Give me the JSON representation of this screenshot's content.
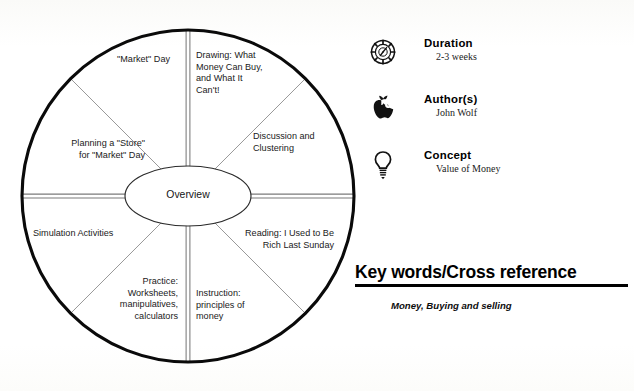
{
  "wheel": {
    "center_label": "Overview",
    "sectors": [
      {
        "id": "market-day",
        "label": "\"Market\" Day"
      },
      {
        "id": "drawing",
        "label": "Drawing: What\nMoney Can Buy,\nand What It\nCan't!"
      },
      {
        "id": "discussion",
        "label": "Discussion and\nClustering"
      },
      {
        "id": "reading",
        "label": "Reading:  I Used to Be\nRich Last Sunday"
      },
      {
        "id": "instruction",
        "label": "Instruction:\nprinciples of\nmoney"
      },
      {
        "id": "practice",
        "label": "Practice:\nWorksheets,\nmanipulatives,\ncalculators"
      },
      {
        "id": "simulation",
        "label": "Simulation Activities"
      },
      {
        "id": "planning-store",
        "label": "Planning a \"Store\"\nfor \"Market\" Day"
      }
    ]
  },
  "info_panel": {
    "rows": [
      {
        "icon": "clock-icon",
        "title": "Duration",
        "value": "2-3 weeks"
      },
      {
        "icon": "apple-icon",
        "title": "Author(s)",
        "value": "John Wolf"
      },
      {
        "icon": "lightbulb-icon",
        "title": "Concept",
        "value": "Value of Money"
      }
    ]
  },
  "keywords": {
    "heading": "Key words/Cross reference",
    "value": "Money, Buying and selling"
  },
  "colors": {
    "ink": "#000000",
    "spoke_gray": "#8a8a8a",
    "paper": "#fdfdfc"
  }
}
